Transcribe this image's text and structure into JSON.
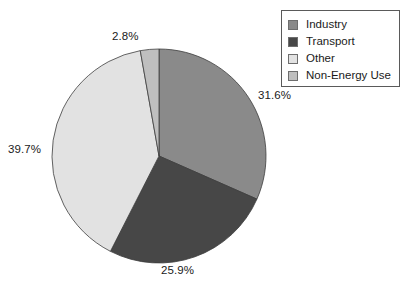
{
  "chart_data": {
    "type": "pie",
    "title": "",
    "subtitle": "",
    "xlabel": "",
    "ylabel": "",
    "grid": false,
    "legend_position": "top-right",
    "start_angle_deg": 0,
    "direction": "clockwise",
    "categories": [
      "Industry",
      "Transport",
      "Other",
      "Non-Energy Use"
    ],
    "values": [
      31.6,
      25.9,
      39.7,
      2.8
    ],
    "value_unit": "%",
    "data_labels": [
      "31.6%",
      "25.9%",
      "39.7%",
      "2.8%"
    ],
    "colors": [
      "#8a8a8a",
      "#474747",
      "#e2e2e2",
      "#bfbfbf"
    ],
    "slices": [
      {
        "label": "Industry",
        "value": 31.6,
        "data_label": "31.6%",
        "color": "#8a8a8a"
      },
      {
        "label": "Transport",
        "value": 25.9,
        "data_label": "25.9%",
        "color": "#474747"
      },
      {
        "label": "Other",
        "value": 39.7,
        "data_label": "39.7%",
        "color": "#e2e2e2"
      },
      {
        "label": "Non-Energy Use",
        "value": 2.8,
        "data_label": "2.8%",
        "color": "#bfbfbf"
      }
    ]
  },
  "legend": {
    "items": [
      {
        "label": "Industry",
        "color": "#8a8a8a"
      },
      {
        "label": "Transport",
        "color": "#474747"
      },
      {
        "label": "Other",
        "color": "#e2e2e2"
      },
      {
        "label": "Non-Energy Use",
        "color": "#bfbfbf"
      }
    ]
  },
  "labels": {
    "industry": "31.6%",
    "transport": "25.9%",
    "other": "39.7%",
    "non_energy_use": "2.8%"
  }
}
